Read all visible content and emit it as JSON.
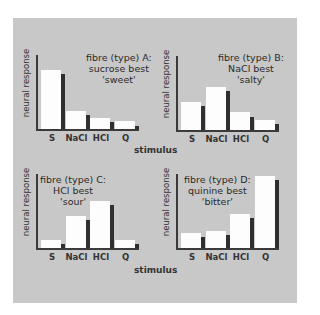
{
  "chart_data": [
    {
      "type": "bar",
      "title": "fibre (type) A: sucrose best 'sweet'",
      "title_lines": [
        "fibre (type) A:",
        "sucrose best",
        "'sweet'"
      ],
      "categories": [
        "S",
        "NaCl",
        "HCl",
        "Q"
      ],
      "series": [
        {
          "name": "response (white)",
          "values": [
            80,
            24,
            15,
            11
          ]
        },
        {
          "name": "response (dark)",
          "values": [
            74,
            19,
            10,
            4
          ]
        }
      ],
      "xlabel": "stimulus",
      "ylabel": "neural response",
      "ylim": [
        0,
        100
      ]
    },
    {
      "type": "bar",
      "title": "fibre (type) B: NaCl best 'salty'",
      "title_lines": [
        "fibre (type) B:",
        "NaCl best",
        "'salty'"
      ],
      "categories": [
        "S",
        "NaCl",
        "HCl",
        "Q"
      ],
      "series": [
        {
          "name": "response (white)",
          "values": [
            38,
            58,
            24,
            14
          ]
        },
        {
          "name": "response (dark)",
          "values": [
            32,
            53,
            18,
            8
          ]
        }
      ],
      "xlabel": "stimulus",
      "ylabel": "neural response",
      "ylim": [
        0,
        100
      ]
    },
    {
      "type": "bar",
      "title": "fibre (type) C: HCl best 'sour'",
      "title_lines": [
        "fibre (type) C:",
        "HCl best",
        "'sour'"
      ],
      "categories": [
        "S",
        "NaCl",
        "HCl",
        "Q"
      ],
      "series": [
        {
          "name": "response (white)",
          "values": [
            11,
            43,
            64,
            11
          ]
        },
        {
          "name": "response (dark)",
          "values": [
            5,
            38,
            58,
            5
          ]
        }
      ],
      "xlabel": "stimulus",
      "ylabel": "neural response",
      "ylim": [
        0,
        100
      ]
    },
    {
      "type": "bar",
      "title": "fibre (type) D: quinine best 'bitter'",
      "title_lines": [
        "fibre (type) D:",
        "quinine best",
        "'bitter'"
      ],
      "categories": [
        "S",
        "NaCl",
        "HCl",
        "Q"
      ],
      "series": [
        {
          "name": "response (white)",
          "values": [
            20,
            23,
            46,
            97
          ]
        },
        {
          "name": "response (dark)",
          "values": [
            15,
            18,
            41,
            92
          ]
        }
      ],
      "xlabel": "stimulus",
      "ylabel": "neural response",
      "ylim": [
        0,
        100
      ]
    }
  ],
  "labels": {
    "ylabel": "neural response",
    "xlabel": "stimulus"
  },
  "colors": {
    "panel_bg": "#c8c8c8",
    "bar_white": "#fdfdfd",
    "bar_dark": "#2f2f2f",
    "axis": "#3a3a3a"
  }
}
